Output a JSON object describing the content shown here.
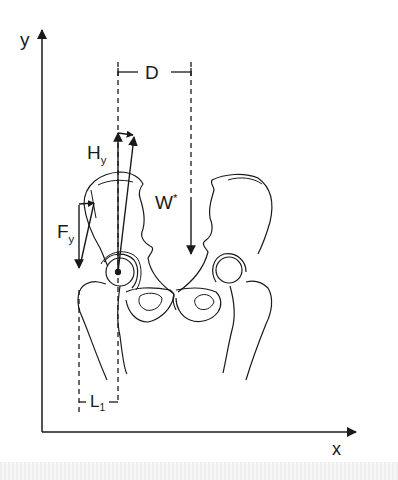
{
  "diagram": {
    "axes": {
      "y_label": "y",
      "x_label": "x"
    },
    "labels": {
      "D": "D",
      "H_main": "H",
      "H_sub": "y",
      "W_main": "W",
      "W_sup": "*",
      "F_main": "F",
      "F_sub": "y",
      "L_main": "L",
      "L_sub": "1"
    },
    "colors": {
      "line": "#1a1a1a",
      "background": "#ffffff"
    }
  }
}
